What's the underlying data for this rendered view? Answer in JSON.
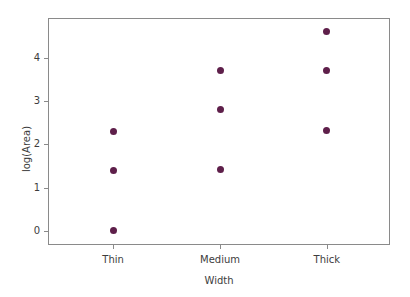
{
  "chart_data": {
    "type": "scatter",
    "title": "",
    "xlabel": "Width",
    "ylabel": "log(Area)",
    "categories": [
      "Thin",
      "Medium",
      "Thick"
    ],
    "x_tick_labels": [
      "Thin",
      "Medium",
      "Thick"
    ],
    "y_tick_labels": [
      "0",
      "1",
      "2",
      "3",
      "4"
    ],
    "y_ticks": [
      0,
      1,
      2,
      3,
      4
    ],
    "ylim": [
      -0.35,
      4.9
    ],
    "xlim": [
      0.4,
      3.6
    ],
    "grid": false,
    "legend": null,
    "marker_color": "#5e1f4a",
    "frame_color": "#8a8a8a",
    "background_color": "#ffffff",
    "series": [
      {
        "name": "log(Area)",
        "points": [
          {
            "category": "Thin",
            "x": 1,
            "y": 2.3
          },
          {
            "category": "Thin",
            "x": 1,
            "y": 1.4
          },
          {
            "category": "Thin",
            "x": 1,
            "y": 0.0
          },
          {
            "category": "Medium",
            "x": 2,
            "y": 3.7
          },
          {
            "category": "Medium",
            "x": 2,
            "y": 2.8
          },
          {
            "category": "Medium",
            "x": 2,
            "y": 1.42
          },
          {
            "category": "Thick",
            "x": 3,
            "y": 4.62
          },
          {
            "category": "Thick",
            "x": 3,
            "y": 3.72
          },
          {
            "category": "Thick",
            "x": 3,
            "y": 2.33
          }
        ]
      }
    ],
    "values_by_category": {
      "Thin": [
        2.3,
        1.4,
        0.0
      ],
      "Medium": [
        3.7,
        2.8,
        1.42
      ],
      "Thick": [
        4.62,
        3.72,
        2.33
      ]
    }
  }
}
